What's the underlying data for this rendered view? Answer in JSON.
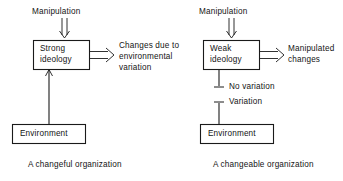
{
  "figure": {
    "background_color": "#ffffff",
    "line_color": "#1a1a1a",
    "text_color": "#141414"
  },
  "panels": [
    {
      "id": "changeful",
      "caption": "A changeful organization",
      "input_label": "Manipulation",
      "core_box": {
        "line1": "Strong",
        "line2": "ideology"
      },
      "output_label": {
        "line1": "Changes due to",
        "line2": "environmental",
        "line3": "variation"
      },
      "source_box": "Environment",
      "link_labels": []
    },
    {
      "id": "changeable",
      "caption": "A changeable organization",
      "input_label": "Manipulation",
      "core_box": {
        "line1": "Weak",
        "line2": "ideology"
      },
      "output_label": {
        "line1": "Manipulated",
        "line2": "changes"
      },
      "source_box": "Environment",
      "link_labels": [
        "No variation",
        "Variation"
      ]
    }
  ]
}
